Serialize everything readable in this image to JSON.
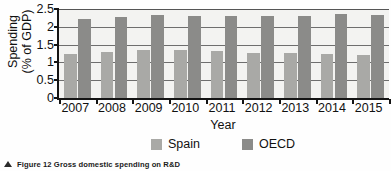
{
  "figure": {
    "caption_marker": "triangle-marker",
    "caption": "Figure 12 Gross domestic spending on R&D"
  },
  "chart_data": {
    "type": "bar",
    "title": "",
    "subtitle": "",
    "xlabel": "Year",
    "ylabel": "Spending\n(% of GDP)",
    "categories": [
      "2007",
      "2008",
      "2009",
      "2010",
      "2011",
      "2012",
      "2013",
      "2014",
      "2015"
    ],
    "series": [
      {
        "name": "Spain",
        "color": "#a9a9a6",
        "values": [
          1.23,
          1.29,
          1.35,
          1.35,
          1.33,
          1.27,
          1.27,
          1.24,
          1.22
        ]
      },
      {
        "name": "OECD",
        "color": "#8b8b89",
        "values": [
          2.21,
          2.27,
          2.33,
          2.29,
          2.31,
          2.29,
          2.31,
          2.36,
          2.32
        ]
      }
    ],
    "ylim": [
      0,
      2.5
    ],
    "yticks": [
      0,
      0.5,
      1,
      1.5,
      2,
      2.5
    ],
    "ytick_labels": [
      "0",
      "0.5",
      "1",
      "1.5",
      "2",
      "2.5"
    ],
    "grid": true,
    "grid_axis": "y",
    "legend_position": "bottom",
    "legend": [
      {
        "label": "Spain",
        "color": "#a9a9a6"
      },
      {
        "label": "OECD",
        "color": "#8b8b89"
      }
    ]
  }
}
